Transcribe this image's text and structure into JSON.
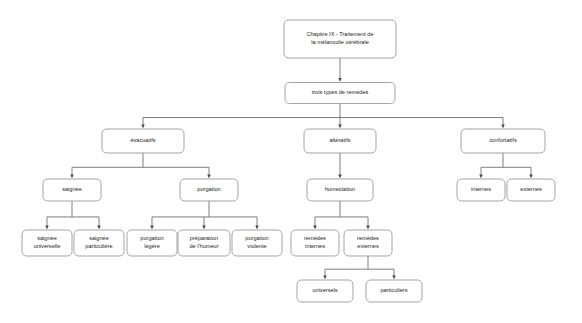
{
  "diagram": {
    "type": "flowchart-tree",
    "orientation": "top-down",
    "background_color": "#ffffff",
    "node_fill": "#ffffff",
    "node_border_color": "#9a9a9a",
    "edge_color": "#6f6f6f",
    "text_color": "#1b1b1b",
    "nodes": [
      {
        "id": "root",
        "lines": [
          "Chapitre IX - Traitement de",
          "la mélancolie cérébrale"
        ],
        "x": 340,
        "y": 39,
        "w": 112,
        "h": 38
      },
      {
        "id": "trois",
        "lines": [
          "trois types de remèdes"
        ],
        "x": 340,
        "y": 93,
        "w": 110,
        "h": 21
      },
      {
        "id": "evacuatifs",
        "lines": [
          "évacuatifs"
        ],
        "x": 143,
        "y": 141,
        "w": 82,
        "h": 24
      },
      {
        "id": "alteratifs",
        "lines": [
          "altératifs"
        ],
        "x": 340,
        "y": 141,
        "w": 72,
        "h": 24
      },
      {
        "id": "confortatifs",
        "lines": [
          "confortatifs"
        ],
        "x": 503,
        "y": 141,
        "w": 84,
        "h": 24
      },
      {
        "id": "saignee",
        "lines": [
          "saignée"
        ],
        "x": 72,
        "y": 190,
        "w": 58,
        "h": 22
      },
      {
        "id": "purgation",
        "lines": [
          "purgation"
        ],
        "x": 209,
        "y": 190,
        "w": 58,
        "h": 22
      },
      {
        "id": "humectation",
        "lines": [
          "humectation"
        ],
        "x": 340,
        "y": 190,
        "w": 66,
        "h": 22
      },
      {
        "id": "internes",
        "lines": [
          "internes"
        ],
        "x": 481,
        "y": 190,
        "w": 48,
        "h": 22
      },
      {
        "id": "externes",
        "lines": [
          "externes"
        ],
        "x": 531,
        "y": 190,
        "w": 48,
        "h": 22
      },
      {
        "id": "saignee-univ",
        "lines": [
          "saignée",
          "universelle"
        ],
        "x": 47,
        "y": 243,
        "w": 50,
        "h": 26
      },
      {
        "id": "saignee-part",
        "lines": [
          "saignée",
          "particulière"
        ],
        "x": 99,
        "y": 243,
        "w": 50,
        "h": 26
      },
      {
        "id": "purg-legere",
        "lines": [
          "purgation",
          "légère"
        ],
        "x": 152,
        "y": 243,
        "w": 50,
        "h": 26
      },
      {
        "id": "prep-humeur",
        "lines": [
          "préparation",
          "de l'humeur"
        ],
        "x": 204,
        "y": 243,
        "w": 52,
        "h": 26
      },
      {
        "id": "purg-viol",
        "lines": [
          "purgation",
          "violente"
        ],
        "x": 257,
        "y": 243,
        "w": 50,
        "h": 26
      },
      {
        "id": "rem-internes",
        "lines": [
          "remèdes",
          "internes"
        ],
        "x": 315,
        "y": 243,
        "w": 48,
        "h": 26
      },
      {
        "id": "rem-externes",
        "lines": [
          "remèdes",
          "externes"
        ],
        "x": 368,
        "y": 243,
        "w": 48,
        "h": 26
      },
      {
        "id": "universels",
        "lines": [
          "universels"
        ],
        "x": 325,
        "y": 291,
        "w": 56,
        "h": 22
      },
      {
        "id": "particuliers",
        "lines": [
          "particuliers"
        ],
        "x": 394,
        "y": 291,
        "w": 56,
        "h": 22
      }
    ],
    "edges": [
      {
        "from": "root",
        "to": "trois"
      },
      {
        "from": "trois",
        "to": "evacuatifs"
      },
      {
        "from": "trois",
        "to": "alteratifs"
      },
      {
        "from": "trois",
        "to": "confortatifs"
      },
      {
        "from": "evacuatifs",
        "to": "saignee"
      },
      {
        "from": "evacuatifs",
        "to": "purgation"
      },
      {
        "from": "alteratifs",
        "to": "humectation"
      },
      {
        "from": "confortatifs",
        "to": "internes"
      },
      {
        "from": "confortatifs",
        "to": "externes"
      },
      {
        "from": "saignee",
        "to": "saignee-univ"
      },
      {
        "from": "saignee",
        "to": "saignee-part"
      },
      {
        "from": "purgation",
        "to": "purg-legere"
      },
      {
        "from": "purgation",
        "to": "prep-humeur"
      },
      {
        "from": "purgation",
        "to": "purg-viol"
      },
      {
        "from": "humectation",
        "to": "rem-internes"
      },
      {
        "from": "humectation",
        "to": "rem-externes"
      },
      {
        "from": "rem-externes",
        "to": "universels"
      },
      {
        "from": "rem-externes",
        "to": "particuliers"
      }
    ]
  }
}
